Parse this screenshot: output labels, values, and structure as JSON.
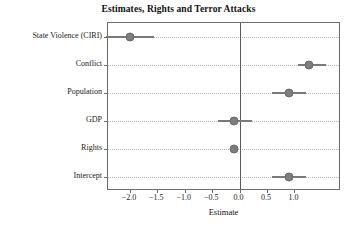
{
  "chart_data": {
    "type": "scatter",
    "title": "Estimates, Rights and Terror Attacks",
    "xlabel": "Estimate",
    "ylabel": "",
    "xlim": [
      -2.4,
      1.85
    ],
    "ylim": [
      0,
      7
    ],
    "grid": true,
    "legend": "none",
    "orientation": "horizontal",
    "reference_line": 0.0,
    "x_ticks": [
      -2.0,
      -1.5,
      -1.0,
      -0.5,
      0.0,
      0.5,
      1.0
    ],
    "x_tick_labels": [
      "-2.0",
      "-1.5",
      "-1.0",
      "-0.5",
      "0.0",
      "0.5",
      "1.0"
    ],
    "categories": [
      "State Violence (CIRI)",
      "Conflict",
      "Population",
      "GDP",
      "Rights",
      "Intercept"
    ],
    "values": [
      -2.0,
      1.27,
      0.9,
      -0.11,
      -0.11,
      0.9
    ],
    "ci_low": [
      -2.43,
      1.07,
      0.6,
      -0.4,
      -0.18,
      0.6
    ],
    "ci_high": [
      -1.57,
      1.58,
      1.22,
      0.22,
      -0.04,
      1.22
    ],
    "series": [
      {
        "name": "Coefficient estimate",
        "marker": "circle",
        "color": "#7d7d7d",
        "points": [
          {
            "label": "State Violence (CIRI)",
            "estimate": -2.0,
            "low": -2.43,
            "high": -1.57
          },
          {
            "label": "Conflict",
            "estimate": 1.27,
            "low": 1.07,
            "high": 1.58
          },
          {
            "label": "Population",
            "estimate": 0.9,
            "low": 0.6,
            "high": 1.22
          },
          {
            "label": "GDP",
            "estimate": -0.11,
            "low": -0.4,
            "high": 0.22
          },
          {
            "label": "Rights",
            "estimate": -0.11,
            "low": -0.18,
            "high": -0.04
          },
          {
            "label": "Intercept",
            "estimate": 0.9,
            "low": 0.6,
            "high": 1.22
          }
        ]
      }
    ]
  },
  "colors": {
    "point": "#7d7d7d",
    "error_bar": "#7a7a7a",
    "axis": "#6d6d6d",
    "grid": "#b8b8b8",
    "zero_line": "#595959",
    "background": "#ffffff",
    "text": "#1a1a1a"
  }
}
